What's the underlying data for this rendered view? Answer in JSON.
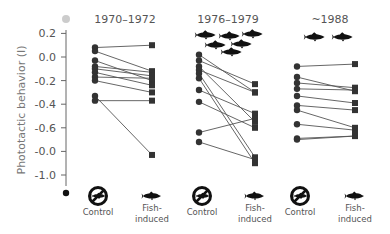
{
  "chart_data": {
    "type": "line",
    "title": "",
    "ylabel": "Phototactic behavior (I)",
    "xlabel": "",
    "ylim": [
      -1.0,
      0.2
    ],
    "yticks": [
      0.2,
      0.0,
      -0.2,
      -0.4,
      -0.6,
      -0.8,
      -1.0
    ],
    "ytick_labels": [
      "0.2",
      "0.0",
      "-0.2",
      "-0.4",
      "-0.6",
      "-0.0",
      "-1.0"
    ],
    "grid": false,
    "legend": "none",
    "condition_labels": {
      "control": "Control",
      "fish_line1": "Fish-",
      "fish_line2": "induced"
    },
    "panels": [
      {
        "period": "1970–1972",
        "fish_icons": 0,
        "pairs": [
          {
            "control": 0.08,
            "fish": 0.1
          },
          {
            "control": 0.05,
            "fish": -0.12
          },
          {
            "control": -0.03,
            "fish": -0.2
          },
          {
            "control": -0.08,
            "fish": -0.13
          },
          {
            "control": -0.1,
            "fish": -0.16
          },
          {
            "control": -0.13,
            "fish": -0.24
          },
          {
            "control": -0.17,
            "fish": -0.18
          },
          {
            "control": -0.2,
            "fish": -0.3
          },
          {
            "control": -0.33,
            "fish": -0.83
          },
          {
            "control": -0.37,
            "fish": -0.37
          }
        ]
      },
      {
        "period": "1976–1979",
        "fish_icons": 7,
        "pairs": [
          {
            "control": 0.02,
            "fish": -0.3
          },
          {
            "control": -0.03,
            "fish": -0.23
          },
          {
            "control": -0.08,
            "fish": -0.55
          },
          {
            "control": -0.11,
            "fish": -0.3
          },
          {
            "control": -0.14,
            "fish": -0.85
          },
          {
            "control": -0.18,
            "fish": -0.9
          },
          {
            "control": -0.28,
            "fish": -0.48
          },
          {
            "control": -0.38,
            "fish": -0.6
          },
          {
            "control": -0.64,
            "fish": -0.52
          },
          {
            "control": -0.72,
            "fish": -0.87
          }
        ]
      },
      {
        "period": "~1988",
        "fish_icons": 2,
        "pairs": [
          {
            "control": -0.08,
            "fish": -0.06
          },
          {
            "control": -0.17,
            "fish": -0.29
          },
          {
            "control": -0.22,
            "fish": -0.26
          },
          {
            "control": -0.27,
            "fish": -0.28
          },
          {
            "control": -0.33,
            "fish": -0.39
          },
          {
            "control": -0.41,
            "fish": -0.45
          },
          {
            "control": -0.45,
            "fish": -0.6
          },
          {
            "control": -0.57,
            "fish": -0.62
          },
          {
            "control": -0.69,
            "fish": -0.67
          },
          {
            "control": -0.7,
            "fish": -0.67
          }
        ]
      }
    ]
  },
  "colors": {
    "points": "#333333",
    "lines": "#555555",
    "axis": "#666666",
    "text": "#555555",
    "top_marker": "#cccccc"
  }
}
